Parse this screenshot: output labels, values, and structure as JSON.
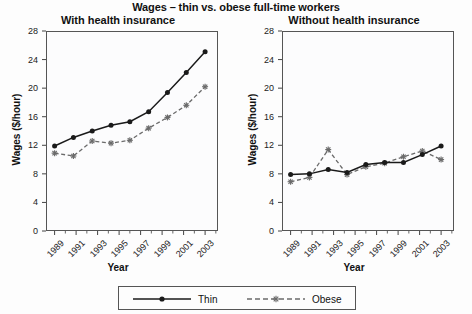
{
  "figure": {
    "title": "Wages – thin vs. obese full-time workers",
    "x_axis_title": "Year",
    "y_axis_title": "Wages ($/hour)"
  },
  "legend": {
    "entries": [
      {
        "label": "Thin",
        "style": "solid-line-filled-circle",
        "color": "#1a1a1a"
      },
      {
        "label": "Obese",
        "style": "dashed-line-star-marker",
        "color": "#6b6b6b"
      }
    ]
  },
  "panels": [
    {
      "key": "with",
      "title": "With health insurance"
    },
    {
      "key": "without",
      "title": "Without health insurance"
    }
  ],
  "axis": {
    "y_ticks": [
      "0",
      "4",
      "8",
      "12",
      "16",
      "20",
      "24",
      "28"
    ],
    "x_ticks": [
      "1989",
      "1991",
      "1993",
      "1995",
      "1997",
      "1999",
      "2001",
      "2003"
    ]
  },
  "chart_data": [
    {
      "type": "line",
      "title": "With health insurance",
      "xlabel": "Year",
      "ylabel": "Wages ($/hour)",
      "x": [
        1989,
        1991,
        1993,
        1995,
        1997,
        1999,
        2001,
        2003
      ],
      "ylim": [
        0,
        28
      ],
      "yticks": [
        0,
        4,
        8,
        12,
        16,
        20,
        24,
        28
      ],
      "grid": false,
      "legend_position": "bottom-outside",
      "series": [
        {
          "name": "Thin",
          "values": [
            11.9,
            13.1,
            14.0,
            14.8,
            15.3,
            16.7,
            19.4,
            22.2,
            25.1
          ]
        },
        {
          "name": "Obese",
          "values": [
            10.9,
            10.5,
            12.6,
            12.3,
            12.7,
            14.4,
            15.9,
            17.6,
            20.2
          ]
        }
      ],
      "x_dense": [
        1989,
        1990,
        1991,
        1992,
        1993,
        1995,
        1997,
        1999,
        2001,
        2003
      ]
    },
    {
      "type": "line",
      "title": "Without health insurance",
      "xlabel": "Year",
      "ylabel": "Wages ($/hour)",
      "x": [
        1989,
        1991,
        1993,
        1995,
        1997,
        1999,
        2001,
        2003
      ],
      "ylim": [
        0,
        28
      ],
      "yticks": [
        0,
        4,
        8,
        12,
        16,
        20,
        24,
        28
      ],
      "grid": false,
      "legend_position": "bottom-outside",
      "series": [
        {
          "name": "Thin",
          "values": [
            7.9,
            8.0,
            8.6,
            8.2,
            9.3,
            9.6,
            9.6,
            10.7,
            11.9
          ]
        },
        {
          "name": "Obese",
          "values": [
            6.9,
            7.5,
            11.4,
            7.9,
            9.0,
            9.5,
            10.4,
            11.2,
            10.0
          ]
        }
      ]
    }
  ]
}
